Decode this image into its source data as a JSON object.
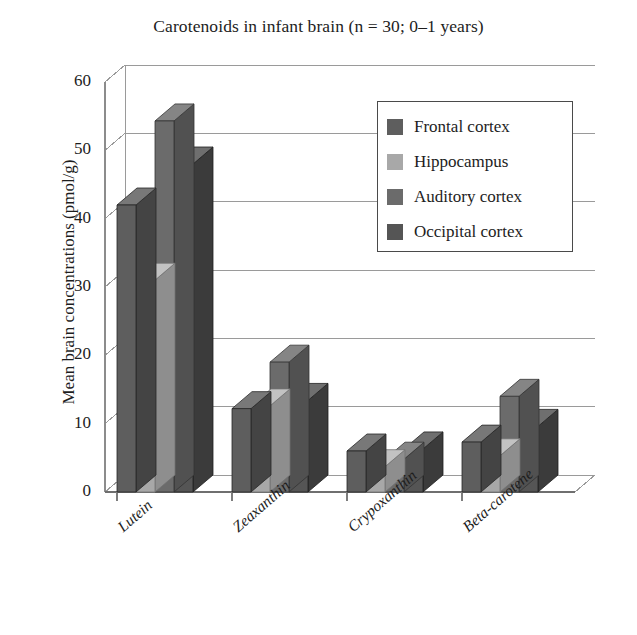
{
  "chart_data": {
    "type": "bar",
    "title": "Carotenoids in infant brain (n = 30; 0–1 years)",
    "subtitle": "",
    "xlabel": "",
    "ylabel": "Mean brain concentrations (pmol/g)",
    "categories": [
      "Lutein",
      "Zeaxanthin",
      "Crypoxanthin",
      "Beta-carotene"
    ],
    "series": [
      {
        "name": "Frontal cortex",
        "color": "#5e5e5e",
        "values": [
          42.0,
          12.2,
          6.0,
          7.3
        ]
      },
      {
        "name": "Hippocampus",
        "color": "#a8a8a8",
        "values": [
          31.0,
          12.6,
          3.7,
          5.3
        ]
      },
      {
        "name": "Auditory cortex",
        "color": "#6b6b6b",
        "values": [
          54.3,
          19.0,
          4.8,
          14.0
        ]
      },
      {
        "name": "Occipital cortex",
        "color": "#555555",
        "values": [
          48.0,
          13.4,
          6.3,
          9.6
        ]
      }
    ],
    "ylim": [
      0,
      60
    ],
    "yticks": [
      0,
      10,
      20,
      30,
      40,
      50,
      60
    ],
    "ytick_labels": [
      "0",
      "10",
      "20",
      "30",
      "40",
      "50",
      "60"
    ],
    "grid": true,
    "grid_axis": "y",
    "legend_position": "upper right",
    "style": "3d-bars",
    "background": "#ffffff"
  },
  "legend": {
    "entries": [
      {
        "label": "Frontal cortex"
      },
      {
        "label": "Hippocampus"
      },
      {
        "label": "Auditory cortex"
      },
      {
        "label": "Occipital cortex"
      }
    ]
  }
}
